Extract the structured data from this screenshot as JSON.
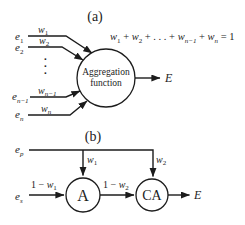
{
  "colors": {
    "ink": "#1c1c1c",
    "background": "#ffffff"
  },
  "part_a": {
    "label": "(a)",
    "formula": {
      "t1": "w",
      "s1": "1",
      "p1": " + ",
      "t2": "w",
      "s2": "2",
      "p2": " + . . . + ",
      "t3": "w",
      "s3": "n−1",
      "p3": " + ",
      "t4": "w",
      "s4": "n",
      "p4": " = 1"
    },
    "inputs": [
      {
        "e": "e",
        "esub": "1",
        "w": "w",
        "wsub": "1"
      },
      {
        "e": "e",
        "esub": "2",
        "w": "w",
        "wsub": "2"
      },
      {
        "e": "e",
        "esub": "n−1",
        "w": "w",
        "wsub": "n−1"
      },
      {
        "e": "e",
        "esub": "n",
        "w": "w",
        "wsub": "n"
      }
    ],
    "dots": [
      ".",
      ".",
      "."
    ],
    "node": {
      "line1": "Aggregation",
      "line2": "function"
    },
    "output": "E"
  },
  "part_b": {
    "label": "(b)",
    "inputs": {
      "primary": {
        "e": "e",
        "sub": "p"
      },
      "secondary": {
        "e": "e",
        "sub": "s"
      }
    },
    "weights": {
      "w1": {
        "t": "w",
        "sub": "1"
      },
      "w2": {
        "t": "w",
        "sub": "2"
      }
    },
    "edges": {
      "e1": {
        "pre": "1 − ",
        "t": "w",
        "sub": "1"
      },
      "e2": {
        "pre": "1 − ",
        "t": "w",
        "sub": "2"
      }
    },
    "nodes": {
      "a": "A",
      "ca": "CA"
    },
    "output": "E"
  }
}
